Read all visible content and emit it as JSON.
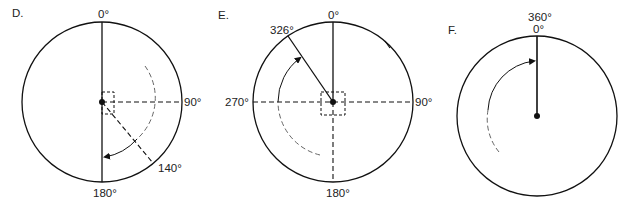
{
  "diagrams": [
    {
      "id": "D",
      "label": "D.",
      "center": [
        102,
        102
      ],
      "radius": 80,
      "degree_labels": {
        "top": "0°",
        "right": "90°",
        "bottom": "180°",
        "bearing": "140°"
      },
      "solid_line": "vertical diameter (0° to 180°)",
      "dashed_lines": [
        "center to 90°",
        "center to 140°"
      ],
      "arc": "dashed/solid arc from ~30° clockwise to 180° with arrowhead",
      "reference_box": true
    },
    {
      "id": "E",
      "label": "E.",
      "center": [
        333,
        102
      ],
      "radius": 80,
      "degree_labels": {
        "top": "0°",
        "right": "90°",
        "bottom": "180°",
        "left": "270°",
        "bearing": "326°"
      },
      "solid_line": "center to 0° and center to 326°",
      "dashed_lines": [
        "horizontal diameter 270°–90°",
        "center to 180°"
      ],
      "arc": "dashed/solid arc from ~200° clockwise to ~320° with arrowhead",
      "tick_mark": "at ~40°",
      "reference_box": true
    },
    {
      "id": "F",
      "label": "F.",
      "center": [
        537,
        116
      ],
      "radius": 80,
      "degree_labels": {
        "top_outer": "360°",
        "top_inner": "0°"
      },
      "solid_line": "center to 0°",
      "arc": "dashed/solid arc from ~215° clockwise to ~358° with arrowhead"
    }
  ]
}
